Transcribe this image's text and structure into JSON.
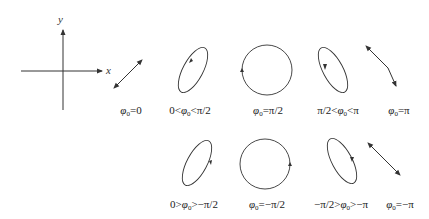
{
  "axes": {
    "x_label": "x",
    "y_label": "y"
  },
  "colors": {
    "stroke": "#333333",
    "background": "#ffffff"
  },
  "row1": {
    "labels": [
      {
        "pre": "",
        "phi": "φ",
        "sub": "0",
        "post": "=0"
      },
      {
        "pre": "0<",
        "phi": "φ",
        "sub": "0",
        "post": "<π/2"
      },
      {
        "pre": "",
        "phi": "φ",
        "sub": "0",
        "post": "=π/2"
      },
      {
        "pre": "π/2<",
        "phi": "φ",
        "sub": "0",
        "post": "<π"
      },
      {
        "pre": "",
        "phi": "φ",
        "sub": "0",
        "post": "=π"
      }
    ]
  },
  "row2": {
    "labels": [
      {
        "pre": "0>",
        "phi": "φ",
        "sub": "0",
        "post": ">−π/2"
      },
      {
        "pre": "",
        "phi": "φ",
        "sub": "0",
        "post": "=−π/2"
      },
      {
        "pre": "−π/2>",
        "phi": "φ",
        "sub": "0",
        "post": ">−π"
      },
      {
        "pre": "",
        "phi": "φ",
        "sub": "0",
        "post": "=−π"
      }
    ]
  },
  "shapes": [
    {
      "id": "phi-0",
      "type": "line",
      "direction": "positive-slope"
    },
    {
      "id": "phi-0-to-pi2",
      "type": "ellipse",
      "tilt": "right",
      "rotation": "counterclockwise"
    },
    {
      "id": "phi-pi2",
      "type": "circle",
      "rotation": "counterclockwise"
    },
    {
      "id": "phi-pi2-to-pi",
      "type": "ellipse",
      "tilt": "left",
      "rotation": "counterclockwise"
    },
    {
      "id": "phi-pi",
      "type": "line",
      "direction": "negative-slope"
    },
    {
      "id": "phi-0-to-negpi2",
      "type": "ellipse",
      "tilt": "right",
      "rotation": "clockwise"
    },
    {
      "id": "phi-negpi2",
      "type": "circle",
      "rotation": "clockwise"
    },
    {
      "id": "phi-negpi2-to-negpi",
      "type": "ellipse",
      "tilt": "left",
      "rotation": "clockwise"
    },
    {
      "id": "phi-negpi",
      "type": "line",
      "direction": "negative-slope"
    }
  ]
}
